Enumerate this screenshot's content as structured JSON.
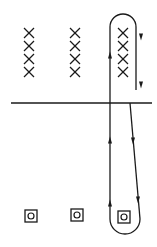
{
  "diagram": {
    "title": "",
    "background": "#ffffff",
    "stroke_color": "#1a1a1a",
    "field_into_page": {
      "symbol": "x-mark",
      "columns_x": [
        29,
        75,
        123
      ],
      "rows_y": [
        33,
        46,
        59,
        72
      ]
    },
    "boundary_line": {
      "x1": 11,
      "x2": 152,
      "y": 103
    },
    "field_out_of_page": {
      "symbol": "dot-in-square",
      "positions": [
        [
          31,
          216
        ],
        [
          77,
          215
        ],
        [
          124,
          217
        ]
      ]
    },
    "loop": {
      "description": "closed conducting loop spanning boundary",
      "left_x": 110,
      "top_arc_center": [
        123,
        25
      ],
      "top_radius": 13,
      "right_upper_x": 136,
      "right_upper_y_end": 90,
      "bottom_arc_center": [
        125,
        219
      ],
      "bottom_radius": 15,
      "arrows": [
        {
          "x": 110,
          "y": 55,
          "direction": "up"
        },
        {
          "x": 141,
          "y": 37,
          "direction": "down"
        },
        {
          "x": 141,
          "y": 85,
          "direction": "down"
        },
        {
          "x": 110,
          "y": 140,
          "direction": "up"
        },
        {
          "x": 133,
          "y": 141,
          "direction": "down"
        },
        {
          "x": 110,
          "y": 203,
          "direction": "up"
        },
        {
          "x": 138,
          "y": 200,
          "direction": "down"
        }
      ]
    }
  }
}
